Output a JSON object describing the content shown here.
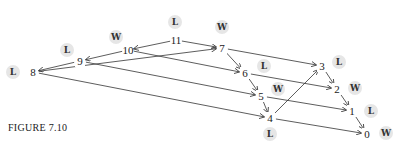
{
  "caption": "FIGURE 7.10",
  "nodes": [
    {
      "id": "11",
      "x": 176,
      "y": 40,
      "status": "L",
      "sx": 175,
      "sy": 22
    },
    {
      "id": "10",
      "x": 128,
      "y": 50,
      "status": "W",
      "sx": 116,
      "sy": 37
    },
    {
      "id": "9",
      "x": 80,
      "y": 61,
      "status": "L",
      "sx": 67,
      "sy": 50
    },
    {
      "id": "8",
      "x": 33,
      "y": 72,
      "status": "L",
      "sx": 13,
      "sy": 72
    },
    {
      "id": "7",
      "x": 222,
      "y": 48,
      "status": "W",
      "sx": 222,
      "sy": 27
    },
    {
      "id": "6",
      "x": 245,
      "y": 73,
      "status": "L",
      "sx": 264,
      "sy": 66
    },
    {
      "id": "5",
      "x": 261,
      "y": 96,
      "status": "W",
      "sx": 278,
      "sy": 89
    },
    {
      "id": "4",
      "x": 270,
      "y": 118,
      "status": "L",
      "sx": 270,
      "sy": 134
    },
    {
      "id": "3",
      "x": 322,
      "y": 66,
      "status": "L",
      "sx": 339,
      "sy": 62
    },
    {
      "id": "2",
      "x": 337,
      "y": 89,
      "status": "W",
      "sx": 355,
      "sy": 88
    },
    {
      "id": "1",
      "x": 352,
      "y": 111,
      "status": "L",
      "sx": 371,
      "sy": 111
    },
    {
      "id": "0",
      "x": 367,
      "y": 134,
      "status": "W",
      "sx": 386,
      "sy": 133
    }
  ],
  "edges": [
    [
      "11",
      "10"
    ],
    [
      "11",
      "7"
    ],
    [
      "10",
      "9"
    ],
    [
      "10",
      "6"
    ],
    [
      "9",
      "8"
    ],
    [
      "9",
      "5"
    ],
    [
      "8",
      "7"
    ],
    [
      "8",
      "4"
    ],
    [
      "7",
      "6"
    ],
    [
      "7",
      "3"
    ],
    [
      "6",
      "5"
    ],
    [
      "6",
      "2"
    ],
    [
      "5",
      "4"
    ],
    [
      "5",
      "1"
    ],
    [
      "4",
      "3"
    ],
    [
      "4",
      "0"
    ],
    [
      "3",
      "2"
    ],
    [
      "2",
      "1"
    ],
    [
      "1",
      "0"
    ]
  ]
}
